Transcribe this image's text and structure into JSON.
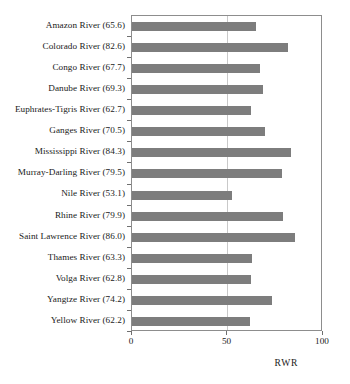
{
  "chart_data": {
    "type": "bar",
    "orientation": "horizontal",
    "title": "",
    "xlabel": "RWR",
    "ylabel": "",
    "xlim": [
      0,
      100
    ],
    "xticks": [
      0,
      50,
      100
    ],
    "xtick_labels": [
      "0",
      "50",
      "100"
    ],
    "grid": "vertical gridline at x=50",
    "legend": "none",
    "bar_color": "#7d7d7d",
    "frame_color": "#8d8d8d",
    "categories": [
      "Amazon River (65.6)",
      "Colorado River (82.6)",
      "Congo River (67.7)",
      "Danube River (69.3)",
      "Euphrates-Tigris River (62.7)",
      "Ganges River (70.5)",
      "Mississippi River (84.3)",
      "Murray-Darling River (79.5)",
      "Nile River (53.1)",
      "Rhine River (79.9)",
      "Saint Lawrence River (86.0)",
      "Thames River (63.3)",
      "Volga River (62.8)",
      "Yangtze River (74.2)",
      "Yellow River (62.2)"
    ],
    "values": [
      65.6,
      82.6,
      67.7,
      69.3,
      62.7,
      70.5,
      84.3,
      79.5,
      53.1,
      79.9,
      86.0,
      63.3,
      62.8,
      74.2,
      62.2
    ]
  }
}
